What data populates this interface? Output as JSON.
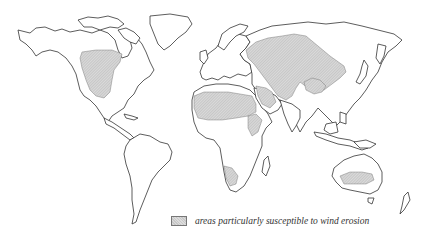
{
  "map": {
    "type": "world outline map",
    "projection": "world",
    "shaded_regions": [
      "Great Plains / western North America",
      "Sahara and North Africa",
      "Arabian Peninsula / Middle East",
      "Central Asia / Siberian steppe",
      "Mongolia / Gobi region",
      "Horn of Africa",
      "Southwestern Africa (Kalahari / Namib)",
      "Central Australia"
    ],
    "colors": {
      "outline": "#333333",
      "shading": "#cfcfcf",
      "background": "#ffffff"
    }
  },
  "legend": {
    "label": "areas particularly susceptible to wind erosion"
  }
}
